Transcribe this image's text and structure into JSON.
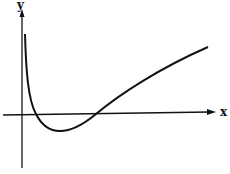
{
  "diagram": {
    "type": "function-graph",
    "axes": {
      "x_label": "x",
      "y_label": "y"
    },
    "curve_description": "Curve descends steeply from near the y-axis, crosses x-axis, reaches a minimum below the x-axis, then rises crossing the x-axis again and continues increasing concavely."
  },
  "colors": {
    "ink": "#111111",
    "background": "#ffffff"
  }
}
